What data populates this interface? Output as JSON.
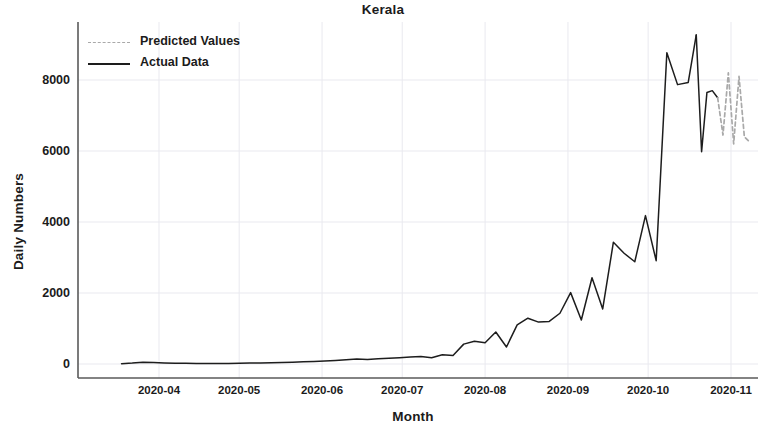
{
  "chart_data": {
    "type": "line",
    "title": "Kerala",
    "xlabel": "Month",
    "ylabel": "Daily Numbers",
    "grid": true,
    "legend_position": "upper left",
    "xtick_labels": [
      "2020-04",
      "2020-05",
      "2020-06",
      "2020-07",
      "2020-08",
      "2020-09",
      "2020-10",
      "2020-11"
    ],
    "ytick_labels": [
      "0",
      "2000",
      "4000",
      "6000",
      "8000"
    ],
    "ytick_values": [
      0,
      2000,
      4000,
      6000,
      8000
    ],
    "ylim": [
      -400,
      9600
    ],
    "xlim": [
      "2020-03-15",
      "2020-11-10"
    ],
    "series": [
      {
        "name": "Actual Data",
        "style": "solid",
        "color": "#1d1d1d",
        "x": [
          "2020-03-18",
          "2020-03-22",
          "2020-03-26",
          "2020-03-30",
          "2020-04-03",
          "2020-04-07",
          "2020-04-11",
          "2020-04-15",
          "2020-04-19",
          "2020-04-23",
          "2020-04-27",
          "2020-05-01",
          "2020-05-05",
          "2020-05-09",
          "2020-05-13",
          "2020-05-17",
          "2020-05-21",
          "2020-05-25",
          "2020-05-29",
          "2020-06-02",
          "2020-06-06",
          "2020-06-10",
          "2020-06-14",
          "2020-06-18",
          "2020-06-22",
          "2020-06-26",
          "2020-06-30",
          "2020-07-04",
          "2020-07-08",
          "2020-07-12",
          "2020-07-16",
          "2020-07-20",
          "2020-07-24",
          "2020-07-28",
          "2020-08-01",
          "2020-08-05",
          "2020-08-09",
          "2020-08-13",
          "2020-08-17",
          "2020-08-21",
          "2020-08-25",
          "2020-08-29",
          "2020-09-02",
          "2020-09-06",
          "2020-09-10",
          "2020-09-14",
          "2020-09-18",
          "2020-09-22",
          "2020-09-26",
          "2020-09-30",
          "2020-10-04",
          "2020-10-08",
          "2020-10-12",
          "2020-10-16",
          "2020-10-19"
        ],
        "values": [
          10,
          25,
          50,
          45,
          30,
          20,
          18,
          15,
          12,
          14,
          16,
          20,
          25,
          30,
          35,
          40,
          50,
          60,
          70,
          85,
          100,
          120,
          140,
          130,
          150,
          160,
          175,
          195,
          210,
          175,
          260,
          240,
          560,
          640,
          600,
          900,
          480,
          1100,
          1290,
          1180,
          1200,
          1430,
          2010,
          1240,
          2430,
          1550,
          3430,
          3120,
          2880,
          4180,
          2910,
          8770,
          7870,
          7930,
          9270
        ]
      },
      {
        "name": "Actual Data (tail)",
        "style": "solid",
        "color": "#1d1d1d",
        "x": [
          "2020-10-19",
          "2020-10-21",
          "2020-10-23",
          "2020-10-25",
          "2020-10-27"
        ],
        "values": [
          9270,
          5980,
          7650,
          7700,
          7500
        ]
      },
      {
        "name": "Predicted Values",
        "style": "dashed",
        "color": "#a9a9a9",
        "x": [
          "2020-10-27",
          "2020-10-29",
          "2020-10-31",
          "2020-11-02",
          "2020-11-04",
          "2020-11-06",
          "2020-11-08"
        ],
        "values": [
          7500,
          6450,
          8200,
          6200,
          8100,
          6400,
          6250
        ]
      }
    ],
    "annotations": []
  },
  "legend": {
    "items": [
      {
        "label": "Predicted Values",
        "style": "dashed",
        "color": "#a9a9a9"
      },
      {
        "label": "Actual Data",
        "style": "solid",
        "color": "#1d1d1d"
      }
    ]
  },
  "axes": {
    "spine_color": "#5a5a5a",
    "grid_color": "#e9e9ef",
    "background": "#ffffff"
  }
}
